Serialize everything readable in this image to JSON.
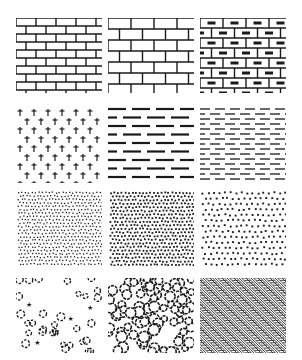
{
  "colors": {
    "ink": "#1a1a1a",
    "background": "#ffffff"
  },
  "grid": {
    "columns": [
      16,
      108,
      200
    ],
    "rows": [
      18,
      105,
      190,
      278
    ],
    "tile_width": 86,
    "tile_heights": [
      75,
      78,
      76,
      75
    ]
  },
  "patterns": [
    {
      "id": "brick-running-small",
      "label": "Running bond brick (small)",
      "row": 0,
      "col": 0
    },
    {
      "id": "brick-running-large",
      "label": "Running bond brick (large)",
      "row": 0,
      "col": 1
    },
    {
      "id": "brick-hollow-block",
      "label": "Brick with cores",
      "row": 0,
      "col": 2
    },
    {
      "id": "crosses",
      "label": "Staggered crosses",
      "row": 1,
      "col": 0
    },
    {
      "id": "dashes-heavy",
      "label": "Heavy dashed lines",
      "row": 1,
      "col": 1
    },
    {
      "id": "dashes-light",
      "label": "Light dashed lines",
      "row": 1,
      "col": 2
    },
    {
      "id": "stipple-fine",
      "label": "Fine stipple",
      "row": 2,
      "col": 0
    },
    {
      "id": "stipple-dense",
      "label": "Dense stipple",
      "row": 2,
      "col": 1
    },
    {
      "id": "stipple-sparse",
      "label": "Sparse stipple",
      "row": 2,
      "col": 2
    },
    {
      "id": "pebbles-sparse",
      "label": "Scattered pebbles and stars",
      "row": 3,
      "col": 0
    },
    {
      "id": "gravel-dense",
      "label": "Dense gravel / aggregate",
      "row": 3,
      "col": 1
    },
    {
      "id": "herringbone",
      "label": "Herringbone",
      "row": 3,
      "col": 2
    }
  ]
}
